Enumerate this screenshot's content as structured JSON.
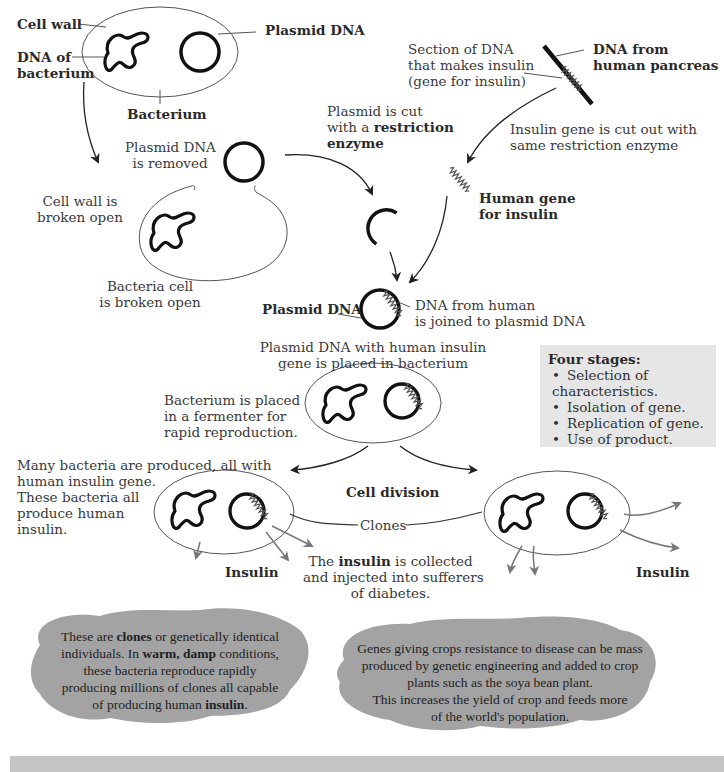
{
  "labels": {
    "cell_wall": "Cell wall",
    "plasmid_dna_top": "Plasmid DNA",
    "dna_of_bacterium_1": "DNA of",
    "dna_of_bacterium_2": "bacterium",
    "bacterium": "Bacterium",
    "section_dna_1": "Section of DNA",
    "section_dna_2": "that makes insulin",
    "section_dna_3": "(gene for insulin)",
    "dna_human_1": "DNA from",
    "dna_human_2": "human pancreas",
    "plasmid_cut_1": "Plasmid is cut",
    "plasmid_cut_2a": "with a ",
    "plasmid_cut_2b": "restriction",
    "plasmid_cut_3": "enzyme",
    "insulin_cut_1": "Insulin gene is cut out with",
    "insulin_cut_2": "same restriction enzyme",
    "plasmid_removed_1": "Plasmid DNA",
    "plasmid_removed_2": "is removed",
    "cell_wall_broken_1": "Cell wall is",
    "cell_wall_broken_2": "broken open",
    "human_gene_1": "Human gene",
    "human_gene_2": "for insulin",
    "bacteria_broken_1": "Bacteria cell",
    "bacteria_broken_2": "is broken open",
    "plasmid_dna_mid": "Plasmid DNA",
    "dna_joined_1": "DNA from human",
    "dna_joined_2": "is joined to plasmid DNA",
    "placed_1": "Plasmid DNA with human insulin",
    "placed_2": "gene is placed in bacterium",
    "fermenter_1": "Bacterium is placed",
    "fermenter_2": "in a fermenter for",
    "fermenter_3": "rapid reproduction.",
    "many_1": "Many bacteria are produced, all with",
    "many_2": "human insulin gene.",
    "many_3": "These bacteria all",
    "many_4": "produce human",
    "many_5": "insulin.",
    "cell_division": "Cell division",
    "clones": "Clones",
    "insulin_left": "Insulin",
    "insulin_right": "Insulin",
    "collected_1a": "The ",
    "collected_1b": "insulin",
    "collected_1c": " is collected",
    "collected_2": "and injected into sufferers",
    "collected_3": "of diabetes."
  },
  "stages": {
    "title": "Four stages:",
    "items": [
      "Selection of characteristics.",
      "Isolation of gene.",
      "Replication of gene.",
      "Use of product."
    ]
  },
  "blob_left": {
    "l1a": "These are ",
    "l1b": "clones",
    "l1c": " or genetically identical",
    "l2a": "individuals. In ",
    "l2b": "warm, damp",
    "l2c": " conditions,",
    "l3": "these bacteria reproduce rapidly",
    "l4": "producing millions of clones all capable",
    "l5a": "of producing human ",
    "l5b": "insulin",
    "l5c": "."
  },
  "blob_right": {
    "l1": "Genes giving crops resistance to disease can be mass",
    "l2": "produced by genetic engineering and added to crop",
    "l3": "plants such as the soya bean plant.",
    "l4": "This increases the yield of crop and feeds more",
    "l5": "of the world's population."
  },
  "colors": {
    "blob": "#a3a3a3",
    "stage_box": "#e6e6e6",
    "bottom_bar": "#c4c4c4",
    "arrow_grey": "#777777"
  }
}
